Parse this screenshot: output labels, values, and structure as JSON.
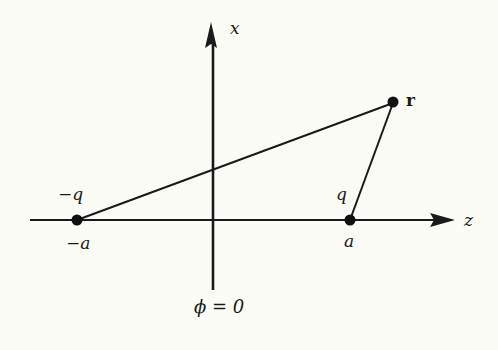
{
  "diagram": {
    "type": "electric-dipole-geometry",
    "background": "#fcfcf7",
    "ink": "#1a1a1a",
    "axes": {
      "vertical": {
        "label": "x",
        "bottom_label": "ϕ = 0"
      },
      "horizontal": {
        "label": "z"
      }
    },
    "points": [
      {
        "id": "neg-charge",
        "charge_label": "−q",
        "position_label": "−a"
      },
      {
        "id": "pos-charge",
        "charge_label": "q",
        "position_label": "a"
      },
      {
        "id": "field-point",
        "label": "r"
      }
    ],
    "segments": [
      {
        "from": "neg-charge",
        "to": "field-point"
      },
      {
        "from": "pos-charge",
        "to": "field-point"
      }
    ]
  }
}
